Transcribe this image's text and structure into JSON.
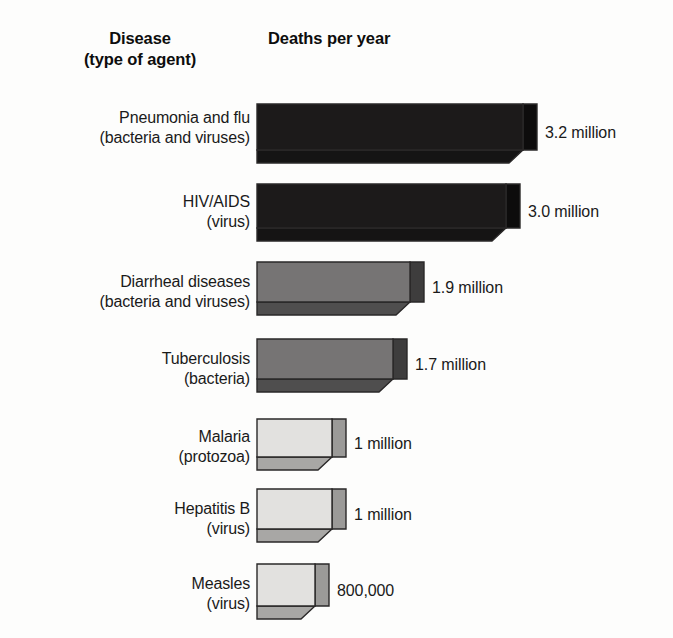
{
  "header": {
    "disease_line1": "Disease",
    "disease_line2": "(type of agent)",
    "deaths_title": "Deaths per year"
  },
  "chart_data": {
    "type": "bar",
    "title": "Deaths per year",
    "xlabel": "Deaths per year",
    "ylabel": "Disease (type of agent)",
    "orientation": "horizontal",
    "style": "3d-isometric",
    "grid": false,
    "legend": false,
    "xlim": [
      0,
      3.2
    ],
    "categories": [
      "Pneumonia and flu (bacteria and viruses)",
      "HIV/AIDS (virus)",
      "Diarrheal diseases (bacteria and viruses)",
      "Tuberculosis (bacteria)",
      "Malaria (protozoa)",
      "Hepatitis B (virus)",
      "Measles (virus)"
    ],
    "values": [
      3.2,
      3.0,
      1.9,
      1.7,
      1.0,
      1.0,
      0.8
    ],
    "value_unit": "million deaths per year",
    "tick_labels": [
      "3.2 million",
      "3.0 million",
      "1.9 million",
      "1.7 million",
      "1 million",
      "1 million",
      "800,000"
    ]
  },
  "colors": {
    "bar_dark_front": "#1c1a1a",
    "bar_dark_side": "#0d0c0c",
    "bar_dark_bottom": "#151414",
    "bar_mid_front": "#767474",
    "bar_mid_side": "#3e3d3d",
    "bar_mid_bottom": "#4f4e4e",
    "bar_light_front": "#e2e1df",
    "bar_light_side": "#9b9a98",
    "bar_light_bottom": "#a8a7a5",
    "outline": "#2a2828",
    "background": "#fdfdfc",
    "text": "#1a1a1a"
  },
  "rows": [
    {
      "name": "pneumonia-and-flu",
      "label_line1": "Pneumonia and flu",
      "label_line2": "(bacteria and viruses)",
      "value_label": "3.2 million",
      "value": 3.2,
      "shade": "dark"
    },
    {
      "name": "hiv-aids",
      "label_line1": "HIV/AIDS",
      "label_line2": "(virus)",
      "value_label": "3.0 million",
      "value": 3.0,
      "shade": "dark"
    },
    {
      "name": "diarrheal-diseases",
      "label_line1": "Diarrheal diseases",
      "label_line2": "(bacteria and viruses)",
      "value_label": "1.9 million",
      "value": 1.9,
      "shade": "mid"
    },
    {
      "name": "tuberculosis",
      "label_line1": "Tuberculosis",
      "label_line2": "(bacteria)",
      "value_label": "1.7 million",
      "value": 1.7,
      "shade": "mid"
    },
    {
      "name": "malaria",
      "label_line1": "Malaria",
      "label_line2": "(protozoa)",
      "value_label": "1 million",
      "value": 1.0,
      "shade": "light"
    },
    {
      "name": "hepatitis-b",
      "label_line1": "Hepatitis B",
      "label_line2": "(virus)",
      "value_label": "1 million",
      "value": 1.0,
      "shade": "light"
    },
    {
      "name": "measles",
      "label_line1": "Measles",
      "label_line2": "(virus)",
      "value_label": "800,000",
      "value": 0.8,
      "shade": "light"
    }
  ]
}
